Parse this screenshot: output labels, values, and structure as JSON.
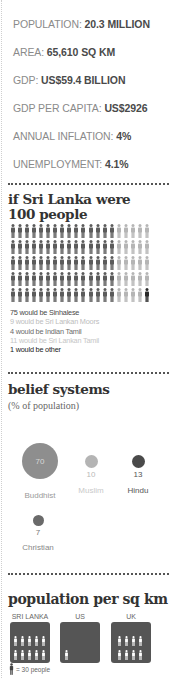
{
  "colors": {
    "dark": "#5b5b5b",
    "mid": "#b5b5b5",
    "black": "#2a2a2a",
    "muted_text": "#b9b9b9",
    "dark_text": "#4a4a4a"
  },
  "facts": [
    {
      "label": "POPULATION: ",
      "value": "20.3 MILLION"
    },
    {
      "label": "AREA: ",
      "value": "65,610 SQ KM"
    },
    {
      "label": "GDP: ",
      "value": "US$59.4 BILLION"
    },
    {
      "label": "GDP PER CAPITA: ",
      "value": "US$2926"
    },
    {
      "label": "ANNUAL INFLATION: ",
      "value": "4%"
    },
    {
      "label": "UNEMPLOYMENT: ",
      "value": "4.1%"
    }
  ],
  "hundred": {
    "title_line1": "if Sri Lanka were",
    "title_line2": "100 people",
    "legend": [
      "75 would be Sinhalese",
      "9 would be Sri Lankan Moors",
      "4 would be Indian Tamil",
      "11 would be Sri Lankan Tamil",
      "1 would be other"
    ]
  },
  "beliefs": {
    "title": "belief systems",
    "subtitle": "(% of population)",
    "items": [
      {
        "name": "Buddhist",
        "value": "70"
      },
      {
        "name": "Muslim",
        "value": "10"
      },
      {
        "name": "Hindu",
        "value": "13"
      },
      {
        "name": "Christian",
        "value": "7"
      }
    ]
  },
  "density": {
    "title": "population per sq km",
    "countries": [
      {
        "name": "SRI LANKA",
        "figures": 10
      },
      {
        "name": "US",
        "figures": 1
      },
      {
        "name": "UK",
        "figures": 8
      }
    ],
    "key": "= 30 people"
  },
  "chart_data": [
    {
      "type": "table",
      "title": "Sri Lanka key facts",
      "rows": [
        [
          "Population",
          "20.3 million"
        ],
        [
          "Area",
          "65,610 sq km"
        ],
        [
          "GDP",
          "US$59.4 billion"
        ],
        [
          "GDP per capita",
          "US$2926"
        ],
        [
          "Annual inflation",
          "4%"
        ],
        [
          "Unemployment",
          "4.1%"
        ]
      ]
    },
    {
      "type": "bar",
      "title": "if Sri Lanka were 100 people",
      "categories": [
        "Sinhalese",
        "Sri Lankan Moors",
        "Indian Tamil",
        "Sri Lankan Tamil",
        "Other"
      ],
      "values": [
        75,
        9,
        4,
        11,
        1
      ]
    },
    {
      "type": "scatter",
      "title": "belief systems",
      "subtitle": "(% of population)",
      "categories": [
        "Buddhist",
        "Muslim",
        "Hindu",
        "Christian"
      ],
      "values": [
        70,
        10,
        13,
        7
      ]
    },
    {
      "type": "bar",
      "title": "population per sq km",
      "categories": [
        "SRI LANKA",
        "US",
        "UK"
      ],
      "values": [
        300,
        30,
        240
      ],
      "unit_note": "1 figure = 30 people"
    }
  ]
}
